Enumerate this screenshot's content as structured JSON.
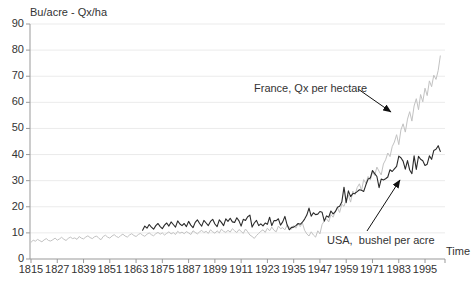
{
  "chart_data": {
    "type": "line",
    "title": "Bu/acre - Qx/ha",
    "xlabel": "Time",
    "ylabel": "",
    "ylim": [
      0,
      90
    ],
    "xlim": [
      1815,
      2002
    ],
    "y_ticks": [
      0,
      10,
      20,
      30,
      40,
      50,
      60,
      70,
      80,
      90
    ],
    "x_ticks": [
      1815,
      1827,
      1839,
      1851,
      1863,
      1875,
      1887,
      1899,
      1911,
      1923,
      1935,
      1947,
      1959,
      1971,
      1983,
      1995
    ],
    "grid": "horizontal-light",
    "legend_position": "none (inline annotations with arrows)",
    "colors": {
      "france_line": "#c2c2c2",
      "usa_line": "#2a2a2a",
      "gridline": "#ebebeb",
      "axis": "#999999",
      "text": "#333333",
      "arrow": "#111111",
      "background": "#ffffff"
    },
    "series": [
      {
        "name": "France, Qx per hectare",
        "unit": "quintals per hectare",
        "start_year": 1815,
        "values": [
          6.4,
          7.2,
          6.8,
          7.5,
          7.0,
          6.6,
          7.3,
          7.8,
          7.1,
          6.9,
          7.4,
          8.0,
          7.2,
          7.7,
          8.3,
          7.6,
          7.1,
          7.9,
          8.4,
          7.8,
          8.1,
          7.5,
          8.6,
          8.0,
          7.7,
          8.4,
          8.9,
          8.2,
          7.8,
          8.5,
          8.8,
          7.9,
          7.4,
          8.6,
          9.1,
          8.4,
          8.0,
          8.8,
          9.3,
          8.6,
          8.2,
          9.0,
          9.5,
          8.8,
          8.4,
          9.2,
          9.7,
          9.0,
          8.6,
          9.4,
          9.8,
          9.1,
          8.7,
          9.5,
          10.0,
          9.3,
          8.9,
          9.7,
          10.2,
          9.5,
          10.0,
          9.2,
          9.8,
          10.4,
          9.6,
          10.1,
          9.4,
          10.6,
          9.9,
          10.3,
          9.7,
          10.5,
          10.0,
          9.4,
          10.8,
          10.2,
          9.6,
          10.4,
          11.0,
          10.1,
          10.6,
          9.8,
          11.2,
          10.4,
          9.9,
          10.8,
          10.0,
          11.4,
          10.6,
          10.2,
          11.0,
          10.3,
          11.6,
          10.8,
          10.1,
          11.3,
          10.6,
          9.8,
          11.5,
          10.4,
          9.2,
          8.6,
          7.9,
          9.0,
          9.8,
          10.6,
          11.2,
          10.2,
          11.8,
          10.8,
          12.2,
          11.0,
          10.4,
          12.6,
          11.6,
          12.0,
          11.2,
          13.0,
          12.2,
          11.4,
          12.8,
          11.8,
          13.4,
          12.4,
          13.8,
          11.0,
          9.6,
          8.8,
          10.4,
          9.2,
          8.4,
          10.8,
          9.6,
          13.2,
          14.6,
          15.4,
          14.2,
          17.0,
          16.0,
          18.2,
          19.6,
          17.8,
          21.0,
          20.2,
          22.6,
          24.4,
          21.8,
          26.0,
          24.6,
          27.4,
          28.8,
          26.2,
          30.4,
          29.0,
          31.6,
          30.2,
          33.4,
          32.0,
          35.2,
          33.6,
          32.2,
          36.4,
          38.0,
          40.6,
          39.2,
          43.0,
          44.8,
          47.6,
          43.8,
          49.4,
          51.8,
          48.6,
          53.6,
          56.4,
          52.8,
          58.6,
          61.4,
          57.2,
          63.0,
          60.2,
          65.4,
          62.6,
          68.2,
          66.0,
          70.4,
          68.8,
          72.2,
          77.8
        ]
      },
      {
        "name": "USA,  bushel per acre",
        "unit": "bushels per acre",
        "start_year": 1866,
        "values": [
          11.0,
          12.6,
          11.8,
          13.2,
          12.2,
          11.4,
          12.8,
          13.6,
          12.4,
          11.6,
          13.0,
          13.8,
          12.6,
          14.2,
          13.2,
          12.2,
          14.6,
          13.4,
          12.8,
          13.6,
          12.4,
          14.4,
          13.0,
          12.0,
          14.0,
          15.0,
          13.6,
          12.6,
          14.8,
          13.8,
          12.8,
          14.4,
          15.2,
          13.4,
          12.4,
          15.0,
          14.0,
          12.8,
          15.4,
          14.4,
          15.6,
          14.2,
          14.0,
          15.8,
          14.6,
          12.6,
          15.2,
          14.8,
          16.2,
          16.8,
          12.2,
          13.8,
          14.8,
          12.8,
          13.5,
          12.7,
          13.8,
          13.3,
          16.0,
          12.8,
          14.7,
          14.7,
          15.4,
          13.0,
          14.2,
          16.3,
          13.1,
          11.2,
          12.1,
          12.2,
          12.8,
          13.6,
          13.3,
          14.1,
          15.3,
          16.8,
          19.5,
          16.4,
          17.7,
          17.0,
          17.2,
          18.2,
          17.9,
          14.5,
          16.5,
          16.0,
          18.4,
          17.3,
          18.1,
          19.8,
          20.2,
          21.8,
          27.5,
          21.6,
          26.1,
          23.9,
          25.0,
          25.2,
          25.8,
          26.5,
          26.3,
          25.9,
          28.4,
          30.6,
          31.0,
          33.9,
          32.7,
          31.6,
          27.3,
          30.6,
          30.3,
          30.7,
          31.4,
          34.2,
          33.5,
          34.5,
          35.5,
          39.4,
          38.8,
          37.5,
          34.4,
          37.7,
          34.1,
          32.7,
          39.5,
          34.3,
          39.3,
          38.2,
          37.6,
          35.8,
          36.3,
          39.5,
          38.2,
          41.6,
          42.0,
          43.4,
          41.2
        ]
      }
    ],
    "annotations": [
      {
        "text": "France, Qx per hectare",
        "arrow_from": [
          358,
          89
        ],
        "arrow_to": [
          391,
          112
        ]
      },
      {
        "text": "USA,  bushel per acre",
        "arrow_from": [
          367,
          231
        ],
        "arrow_to": [
          400,
          180
        ]
      }
    ]
  }
}
